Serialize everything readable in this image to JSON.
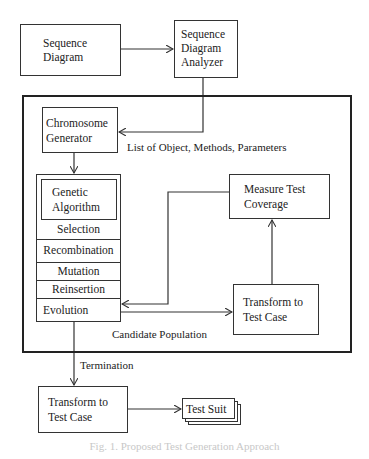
{
  "diagram": {
    "nodes": {
      "sequence_diagram": [
        "Sequence",
        "Diagram"
      ],
      "analyzer": [
        "Sequence",
        "Diagram",
        "Analyzer"
      ],
      "chromosome_generator": [
        "Chromosome",
        "Generator"
      ],
      "genetic_algorithm": [
        "Genetic",
        "Algorithm"
      ],
      "ga_steps": [
        "Selection",
        "Recombination",
        "Mutation",
        "Reinsertion",
        "Evolution"
      ],
      "measure_coverage": [
        "Measure Test",
        "Coverage"
      ],
      "transform_inner": [
        "Transform to",
        "Test Case"
      ],
      "transform_outer": [
        "Transform to",
        "Test Case"
      ],
      "test_suit": "Test Suit"
    },
    "edge_labels": {
      "list": "List of Object, Methods, Parameters",
      "candidate": "Candidate Population",
      "termination": "Termination"
    },
    "caption": "Fig. 1. Proposed Test Generation Approach"
  }
}
